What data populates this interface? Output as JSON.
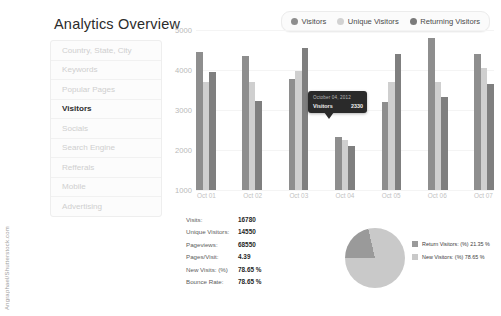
{
  "header": {
    "title": "Analytics Overview"
  },
  "sidebar": {
    "items": [
      {
        "label": "Country, State, City",
        "active": false
      },
      {
        "label": "Keywords",
        "active": false
      },
      {
        "label": "Popular Pages",
        "active": false
      },
      {
        "label": "Visitors",
        "active": true
      },
      {
        "label": "Socials",
        "active": false
      },
      {
        "label": "Search Engine",
        "active": false
      },
      {
        "label": "Refferals",
        "active": false
      },
      {
        "label": "Mobile",
        "active": false
      },
      {
        "label": "Advertising",
        "active": false
      }
    ]
  },
  "legend": {
    "items": [
      {
        "label": "Visitors",
        "color": "#8e8e8e"
      },
      {
        "label": "Unique Visitors",
        "color": "#d2d2d2"
      },
      {
        "label": "Returning Visitors",
        "color": "#7a7a7a"
      }
    ]
  },
  "tooltip": {
    "date": "October 04, 2012",
    "metric": "Visitors",
    "value": "2330"
  },
  "stats": {
    "rows": [
      {
        "label": "Visits:",
        "value": "16780"
      },
      {
        "label": "Unique Visitors:",
        "value": "14550"
      },
      {
        "label": "Pageviews:",
        "value": "68550"
      },
      {
        "label": "Pages/Visit:",
        "value": "4.39"
      },
      {
        "label": "New Visits: (%)",
        "value": "78.65 %"
      },
      {
        "label": "Bounce Rate:",
        "value": "78.65 %"
      }
    ]
  },
  "pie_legend": {
    "items": [
      {
        "label": "Return Visitors: (%) 21.35 %",
        "color": "#9a9a9a"
      },
      {
        "label": "New Visitors: (%) 78.65 %",
        "color": "#c9c9c9"
      }
    ]
  },
  "watermark": {
    "text": "Angraphael/Shutterstock.com"
  },
  "chart_data": {
    "type": "bar",
    "title": "Analytics Overview",
    "xlabel": "",
    "ylabel": "",
    "ylim": [
      1000,
      5000
    ],
    "yticks": [
      1000,
      2000,
      3000,
      4000,
      5000
    ],
    "grid": false,
    "legend_position": "top-right",
    "categories": [
      "Oct 01",
      "Oct 02",
      "Oct 03",
      "Oct 04",
      "Oct 05",
      "Oct 06",
      "Oct 07"
    ],
    "series": [
      {
        "name": "Visitors",
        "color": "#8e8e8e",
        "values": [
          4450,
          4350,
          3780,
          2330,
          3200,
          4800,
          4400
        ]
      },
      {
        "name": "Unique Visitors",
        "color": "#cfcfcf",
        "values": [
          3700,
          3700,
          3980,
          2250,
          3700,
          3700,
          4050
        ]
      },
      {
        "name": "Returning Visitors",
        "color": "#7f7f7f",
        "values": [
          3950,
          3230,
          4550,
          2100,
          4400,
          3330,
          3650
        ]
      }
    ]
  },
  "pie_data": {
    "type": "pie",
    "slices": [
      {
        "name": "Return Visitors",
        "value": 21.35,
        "color": "#9a9a9a"
      },
      {
        "name": "New Visitors",
        "value": 78.65,
        "color": "#c9c9c9"
      }
    ]
  }
}
